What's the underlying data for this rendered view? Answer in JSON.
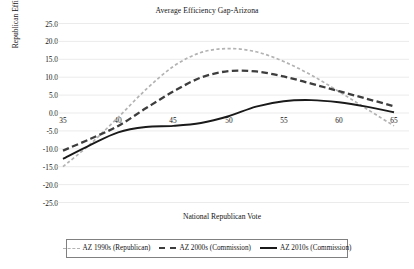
{
  "chart_data": {
    "type": "line",
    "title": "Average Efficiency Gap-Arizona",
    "xlabel": "National Republican Vote",
    "ylabel": "Republican Efficiency Gap",
    "xlim": [
      35,
      65
    ],
    "ylim": [
      -25.0,
      25.0
    ],
    "xticks": [
      35,
      40,
      45,
      50,
      55,
      60,
      65
    ],
    "yticks": [
      "25.0",
      "20.0",
      "15.0",
      "10.0",
      "5.0",
      "0.0",
      "-5.0",
      "-10.0",
      "-15.0",
      "-20.0",
      "-25.0"
    ],
    "grid": true,
    "legend_position": "bottom",
    "x": [
      35,
      37.5,
      40,
      42.5,
      45,
      47.5,
      50,
      52.5,
      55,
      57.5,
      60,
      62.5,
      65
    ],
    "series": [
      {
        "name": "AZ 1990s (Republican)",
        "color": "#b3b3b3",
        "style": "fine-dashed",
        "values": [
          -15.0,
          -8.6,
          -1.2,
          6.5,
          13.0,
          16.9,
          18.0,
          17.1,
          14.4,
          10.6,
          6.0,
          1.2,
          -3.6
        ]
      },
      {
        "name": "AZ 2000s (Commission)",
        "color": "#3d3d3d",
        "style": "long-dashed",
        "values": [
          -10.5,
          -7.2,
          -3.6,
          1.3,
          6.0,
          9.9,
          11.7,
          11.6,
          10.2,
          8.2,
          6.1,
          4.0,
          1.9
        ]
      },
      {
        "name": "AZ 2010s (Commission)",
        "color": "#1a1a1a",
        "style": "solid",
        "values": [
          -12.8,
          -8.9,
          -5.4,
          -3.9,
          -3.6,
          -2.8,
          -0.9,
          1.8,
          3.3,
          3.6,
          3.0,
          1.8,
          0.2
        ]
      }
    ]
  },
  "title": {
    "text": "Average Efficiency Gap-Arizona"
  },
  "axes": {
    "y_label": "Republican Efficiency Gap",
    "x_label": "National Republican Vote",
    "y_ticks": [
      {
        "label": "25.0"
      },
      {
        "label": "20.0"
      },
      {
        "label": "15.0"
      },
      {
        "label": "10.0"
      },
      {
        "label": "5.0"
      },
      {
        "label": "0.0"
      },
      {
        "label": "-5.0"
      },
      {
        "label": "-10.0"
      },
      {
        "label": "-15.0"
      },
      {
        "label": "-20.0"
      },
      {
        "label": "-25.0"
      }
    ],
    "x_ticks": [
      {
        "label": "35"
      },
      {
        "label": "40"
      },
      {
        "label": "45"
      },
      {
        "label": "50"
      },
      {
        "label": "55"
      },
      {
        "label": "60"
      },
      {
        "label": "65"
      }
    ]
  },
  "legend": {
    "items": [
      {
        "label": "AZ 1990s (Republican)"
      },
      {
        "label": "AZ 2000s (Commission)"
      },
      {
        "label": "AZ 2010s (Commission)"
      }
    ]
  }
}
